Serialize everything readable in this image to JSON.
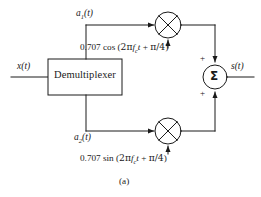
{
  "figure": {
    "caption": "(a)",
    "background_color": "#ffffff",
    "line_color": "#1a1a1a"
  },
  "blocks": {
    "demultiplexer": {
      "label": "Demultiplexer",
      "shape": "rectangle"
    },
    "summer": {
      "glyph": "Σ",
      "shape": "circle",
      "input_sign_top": "+",
      "input_sign_bottom": "+"
    },
    "mixer_top": {
      "icon_name": "multiplier-icon",
      "shape": "circle-with-x"
    },
    "mixer_bottom": {
      "icon_name": "multiplier-icon",
      "shape": "circle-with-x"
    }
  },
  "signals": {
    "input": {
      "base": "x",
      "arg": "(t)",
      "full": "x(t)"
    },
    "branch_top": {
      "base": "a",
      "subscript": "1",
      "arg": "(t)",
      "full": "a1(t)"
    },
    "branch_bottom": {
      "base": "a",
      "subscript": "2",
      "arg": "(t)",
      "full": "a2(t)"
    },
    "output": {
      "base": "s",
      "arg": "(t)",
      "full": "s(t)"
    }
  },
  "carriers": {
    "cosine": {
      "amplitude": "0.707",
      "function": "cos",
      "open_paren": "(",
      "two_pi": "2π",
      "freq_base": "f",
      "freq_subscript": "c",
      "time_var": "t",
      "plus": "+",
      "phase": "π/4",
      "close_paren": ")",
      "full": "0.707 cos (2πfct + π/4)"
    },
    "sine": {
      "amplitude": "0.707",
      "function": "sin",
      "open_paren": "(",
      "two_pi": "2π",
      "freq_base": "f",
      "freq_subscript": "c",
      "time_var": "t",
      "plus": "+",
      "phase": "π/4",
      "close_paren": ")",
      "full": "0.707 sin (2πfct + π/4)"
    }
  }
}
